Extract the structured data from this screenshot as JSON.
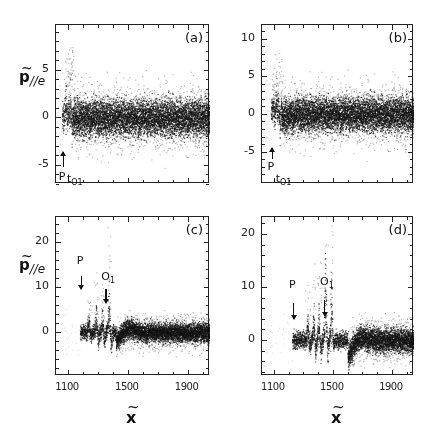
{
  "figure": {
    "ylabel": "p",
    "ylabel_sub": "//e",
    "xlabel": "x",
    "tilde": "~"
  },
  "panels": [
    {
      "tag": "(a)",
      "box": {
        "left": 55,
        "top": 24,
        "width": 154,
        "height": 159
      },
      "xlim": [
        1020,
        2050
      ],
      "ylim": [
        -7.0,
        9.7
      ],
      "yticks": [
        {
          "v": 5,
          "label": "5"
        },
        {
          "v": 0,
          "label": "0"
        },
        {
          "v": -5,
          "label": "-5"
        }
      ],
      "xticks": [],
      "show_ylabel": true,
      "show_xlabel": false,
      "annotations": [
        {
          "label": "P",
          "sub": "",
          "x": 1065,
          "arrow": "up",
          "arrow_top": -3.6,
          "arrow_bot": -5.2,
          "text_y": -5.6
        },
        {
          "label": "t",
          "sub": "O1",
          "x": 1120,
          "arrow": "none",
          "arrow_top": 0,
          "arrow_bot": 0,
          "text_y": -5.8
        }
      ],
      "signal": {
        "start": 1060,
        "burst_end": 1130,
        "spikes": [
          1085,
          1100,
          1115,
          1128
        ],
        "spike_amp": [
          3.0,
          3.2,
          5.0,
          4.0
        ],
        "neg_amp": [
          -2.5,
          -3.0,
          -6.5,
          -1.5
        ],
        "noise": 1.1,
        "tail_wave": 0.0,
        "tail_dip": 0.0
      }
    },
    {
      "tag": "(b)",
      "box": {
        "left": 261,
        "top": 24,
        "width": 152,
        "height": 159
      },
      "xlim": [
        1020,
        2050
      ],
      "ylim": [
        -9.3,
        11.8
      ],
      "yticks": [
        {
          "v": 10,
          "label": "10"
        },
        {
          "v": 5,
          "label": "5"
        },
        {
          "v": 0,
          "label": "0"
        },
        {
          "v": -5,
          "label": "-5"
        }
      ],
      "xticks": [],
      "show_ylabel": false,
      "show_xlabel": false,
      "annotations": [
        {
          "label": "P",
          "sub": "",
          "x": 1085,
          "arrow": "up",
          "arrow_top": -4.5,
          "arrow_bot": -6.0,
          "text_y": -6.3
        },
        {
          "label": "t",
          "sub": "O1",
          "x": 1140,
          "arrow": "none",
          "arrow_top": 0,
          "arrow_bot": 0,
          "text_y": -7.8
        }
      ],
      "signal": {
        "start": 1080,
        "burst_end": 1150,
        "spikes": [
          1095,
          1115,
          1130,
          1148
        ],
        "spike_amp": [
          3.0,
          4.5,
          5.0,
          4.5
        ],
        "neg_amp": [
          -2.5,
          -3.0,
          -6.5,
          -1.8
        ],
        "noise": 1.3,
        "tail_wave": 0.0,
        "tail_dip": -0.5
      }
    },
    {
      "tag": "(c)",
      "box": {
        "left": 55,
        "top": 216,
        "width": 154,
        "height": 159
      },
      "xlim": [
        1020,
        2050
      ],
      "ylim": [
        -9.7,
        25.5
      ],
      "yticks": [
        {
          "v": 20,
          "label": "20"
        },
        {
          "v": 10,
          "label": "10"
        },
        {
          "v": 0,
          "label": "0"
        }
      ],
      "xticks": [
        {
          "v": 1100,
          "label": "1100"
        },
        {
          "v": 1500,
          "label": "1500"
        },
        {
          "v": 1900,
          "label": "1900"
        }
      ],
      "show_ylabel": true,
      "show_xlabel": true,
      "annotations": [
        {
          "label": "P",
          "sub": "",
          "x": 1185,
          "arrow": "down",
          "arrow_top": 12.5,
          "arrow_bot": 9.5,
          "text_y": 17.0
        },
        {
          "label": "O",
          "sub": "1",
          "x": 1350,
          "arrow": "down",
          "arrow_top": 9.5,
          "arrow_bot": 6.5,
          "text_y": 13.5
        }
      ],
      "signal": {
        "start": 1180,
        "burst_end": 1420,
        "spikes": [
          1240,
          1290,
          1330,
          1375
        ],
        "spike_amp": [
          4.0,
          7.0,
          6.5,
          12.0
        ],
        "neg_amp": [
          -2.0,
          -4.5,
          -5.0,
          -6.0
        ],
        "noise": 1.2,
        "tail_wave": 2.0,
        "tail_dip": -2.0
      }
    },
    {
      "tag": "(d)",
      "box": {
        "left": 261,
        "top": 216,
        "width": 152,
        "height": 159
      },
      "xlim": [
        1020,
        2050
      ],
      "ylim": [
        -6.8,
        23.2
      ],
      "yticks": [
        {
          "v": 20,
          "label": "20"
        },
        {
          "v": 10,
          "label": "10"
        },
        {
          "v": 0,
          "label": "0"
        }
      ],
      "xticks": [
        {
          "v": 1100,
          "label": "1100"
        },
        {
          "v": 1500,
          "label": "1500"
        },
        {
          "v": 1900,
          "label": "1900"
        }
      ],
      "show_ylabel": false,
      "show_xlabel": true,
      "annotations": [
        {
          "label": "P",
          "sub": "",
          "x": 1230,
          "arrow": "down",
          "arrow_top": 7.0,
          "arrow_bot": 4.0,
          "text_y": 11.5
        },
        {
          "label": "O",
          "sub": "1",
          "x": 1440,
          "arrow": "down",
          "arrow_top": 7.5,
          "arrow_bot": 4.5,
          "text_y": 12.0
        }
      ],
      "signal": {
        "start": 1225,
        "burst_end": 1600,
        "spikes": [
          1330,
          1370,
          1405,
          1450,
          1490
        ],
        "spike_amp": [
          5.0,
          7.0,
          8.0,
          20.0,
          15.0
        ],
        "neg_amp": [
          -3.0,
          -4.5,
          -5.5,
          -6.5,
          -3.0
        ],
        "noise": 1.3,
        "tail_wave": 1.8,
        "tail_dip": -3.5
      }
    }
  ],
  "chart_data": [
    {
      "type": "scatter",
      "panel": "(a)",
      "title": "",
      "xlabel": "x~",
      "ylabel": "p~//e",
      "xlim": [
        1020,
        2050
      ],
      "ylim": [
        -7,
        9.7
      ],
      "yticks": [
        -5,
        0,
        5
      ],
      "annotations": [
        "P (arrow, x≈1065)",
        "tO1 (x≈1120)"
      ],
      "description": "Particle momentum scatter: short burst of sharp oscillation spikes near x≈1060-1130 reaching ~+5 and ~-6.5, followed by noisy band centered at 0 with spread ≈ ±2 out to x≈2050",
      "series": [
        {
          "name": "burst_peaks",
          "x": [
            1085,
            1100,
            1115,
            1128
          ],
          "y_max": [
            3.0,
            3.2,
            5.0,
            4.0
          ],
          "y_min": [
            -2.5,
            -3.0,
            -6.5,
            -1.5
          ]
        },
        {
          "name": "noise_band",
          "x_range": [
            1130,
            2050
          ],
          "center": 0,
          "spread": 2.0
        }
      ]
    },
    {
      "type": "scatter",
      "panel": "(b)",
      "title": "",
      "xlabel": "x~",
      "ylabel": "p~//e",
      "xlim": [
        1020,
        2050
      ],
      "ylim": [
        -9.3,
        11.8
      ],
      "yticks": [
        -5,
        0,
        5,
        10
      ],
      "annotations": [
        "P (arrow, x≈1085)",
        "tO1 (x≈1140)"
      ],
      "description": "Burst of oscillations near x≈1080-1150 reaching ~+5 (outliers to ~10) and ~-6.5, followed by noisy band near 0 (slightly negative) with spread ≈ ±2.5",
      "series": [
        {
          "name": "burst_peaks",
          "x": [
            1095,
            1115,
            1130,
            1148
          ],
          "y_max": [
            3.0,
            4.5,
            5.0,
            4.5
          ],
          "y_min": [
            -2.5,
            -3.0,
            -6.5,
            -1.8
          ]
        },
        {
          "name": "noise_band",
          "x_range": [
            1150,
            2050
          ],
          "center": -0.5,
          "spread": 2.5
        }
      ]
    },
    {
      "type": "scatter",
      "panel": "(c)",
      "title": "",
      "xlabel": "x~",
      "ylabel": "p~//e",
      "xlim": [
        1020,
        2050
      ],
      "ylim": [
        -9.7,
        25.5
      ],
      "xticks": [
        1100,
        1500,
        1900
      ],
      "yticks": [
        0,
        10,
        20
      ],
      "annotations": [
        "P (arrow, x≈1185)",
        "O1 (arrow, x≈1350)"
      ],
      "description": "Signal starts at x≈1180; growing oscillations up to ~+12 (outliers to ~22) and down to ~-6 near x≈1350-1380, then a dip to ~-2 and a noisy band near 0 (spread ±2) to x≈2050",
      "series": [
        {
          "name": "burst_peaks",
          "x": [
            1240,
            1290,
            1330,
            1375
          ],
          "y_max": [
            4.0,
            7.0,
            6.5,
            12.0
          ],
          "y_min": [
            -2.0,
            -4.5,
            -5.0,
            -6.0
          ]
        },
        {
          "name": "noise_band",
          "x_range": [
            1420,
            2050
          ],
          "center": 0.5,
          "spread": 2.0
        }
      ]
    },
    {
      "type": "scatter",
      "panel": "(d)",
      "title": "",
      "xlabel": "x~",
      "ylabel": "p~//e",
      "xlim": [
        1020,
        2050
      ],
      "ylim": [
        -6.8,
        23.2
      ],
      "xticks": [
        1100,
        1500,
        1900
      ],
      "yticks": [
        0,
        10,
        20
      ],
      "annotations": [
        "P (arrow, x≈1230)",
        "O1 (arrow, x≈1440)"
      ],
      "description": "Signal starts at x≈1225; several sharp oscillations between x≈1330-1500 with scattered outliers reaching ~+20 and minima ~-6.5, broad dip to ~-3.5 near x≈1550, then noisy band near 0 (spread ±2) to x≈2050",
      "series": [
        {
          "name": "burst_peaks",
          "x": [
            1330,
            1370,
            1405,
            1450,
            1490
          ],
          "y_max": [
            5.0,
            7.0,
            8.0,
            20.0,
            15.0
          ],
          "y_min": [
            -3.0,
            -4.5,
            -5.5,
            -6.5,
            -3.0
          ]
        },
        {
          "name": "noise_band",
          "x_range": [
            1600,
            2050
          ],
          "center": 0.3,
          "spread": 2.0
        }
      ]
    }
  ]
}
